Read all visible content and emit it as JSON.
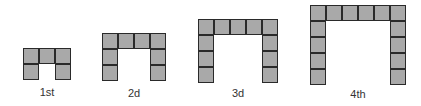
{
  "colors": {
    "cell_fill": "#a9a9a9",
    "cell_border": "#2a2a2a",
    "label": "#333333"
  },
  "cell_size": 16,
  "figures": [
    {
      "label": "1st",
      "left": 23,
      "top": 48,
      "cols": 3,
      "arm_rows": 2,
      "label_x": 47,
      "label_y": 86
    },
    {
      "label": "2d",
      "left": 102,
      "top": 33,
      "cols": 4,
      "arm_rows": 3,
      "label_x": 134,
      "label_y": 87
    },
    {
      "label": "3d",
      "left": 198,
      "top": 19,
      "cols": 5,
      "arm_rows": 4,
      "label_x": 238,
      "label_y": 87
    },
    {
      "label": "4th",
      "left": 310,
      "top": 5,
      "cols": 6,
      "arm_rows": 5,
      "label_x": 358,
      "label_y": 88
    }
  ]
}
